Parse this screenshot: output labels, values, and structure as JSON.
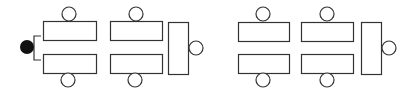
{
  "diagram": {
    "title": "",
    "type": "seating-layout",
    "colors": {
      "stroke": "#333333",
      "fill": "#ffffff",
      "presenter": "#111111"
    },
    "presenter": {
      "cx": 27,
      "cy": 47,
      "r": 7
    },
    "bracket": {
      "x1": 41,
      "x2": 34,
      "y1": 36,
      "y2": 60
    },
    "groups": [
      {
        "name": "left-group",
        "tables": [
          {
            "x": 43,
            "y": 21,
            "w": 53,
            "h": 19
          },
          {
            "x": 43,
            "y": 54,
            "w": 53,
            "h": 19
          },
          {
            "x": 110,
            "y": 21,
            "w": 52,
            "h": 19
          },
          {
            "x": 110,
            "y": 54,
            "w": 52,
            "h": 19
          },
          {
            "x": 168,
            "y": 22,
            "w": 20,
            "h": 52
          }
        ],
        "seats": [
          {
            "cx": 69,
            "cy": 14
          },
          {
            "cx": 68,
            "cy": 80
          },
          {
            "cx": 136,
            "cy": 14
          },
          {
            "cx": 135,
            "cy": 80
          },
          {
            "cx": 196,
            "cy": 48
          }
        ]
      },
      {
        "name": "right-group",
        "tables": [
          {
            "x": 238,
            "y": 22,
            "w": 51,
            "h": 19
          },
          {
            "x": 238,
            "y": 54,
            "w": 51,
            "h": 19
          },
          {
            "x": 301,
            "y": 22,
            "w": 52,
            "h": 19
          },
          {
            "x": 301,
            "y": 54,
            "w": 52,
            "h": 19
          },
          {
            "x": 361,
            "y": 22,
            "w": 20,
            "h": 52
          }
        ],
        "seats": [
          {
            "cx": 263,
            "cy": 14
          },
          {
            "cx": 263,
            "cy": 80
          },
          {
            "cx": 327,
            "cy": 14
          },
          {
            "cx": 327,
            "cy": 80
          },
          {
            "cx": 389,
            "cy": 48
          }
        ]
      }
    ],
    "seat_radius": 7
  }
}
